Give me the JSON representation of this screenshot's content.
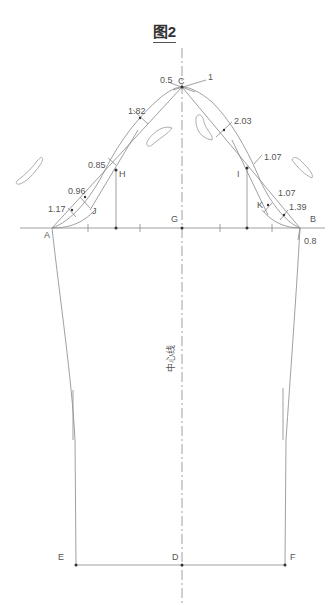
{
  "title": "图2",
  "center_line_label": "中心线",
  "points": {
    "A": "A",
    "B": "B",
    "C": "C",
    "D": "D",
    "E": "E",
    "F": "F",
    "G": "G",
    "H": "H",
    "I": "I",
    "J": "J",
    "K": "K"
  },
  "measurements": {
    "c_left": "0.5",
    "c_right": "1",
    "upper_left": "1.82",
    "upper_right": "2.03",
    "h_offset": "0.85",
    "i_offset": "1.07",
    "j_upper": "0.96",
    "j_lower": "1.17",
    "k_upper": "1.07",
    "k_lower": "1.39",
    "b_drop": "0.8"
  },
  "colors": {
    "line": "#777777",
    "text": "#555555"
  }
}
